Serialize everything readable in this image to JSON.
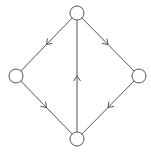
{
  "diagram": {
    "type": "directed-graph",
    "colors": {
      "stroke": "#555555",
      "node_fill": "#ffffff",
      "background": "#ffffff"
    },
    "node_radius": 7,
    "nodes": [
      {
        "id": "top",
        "x": 77,
        "y": 13
      },
      {
        "id": "left",
        "x": 16,
        "y": 76
      },
      {
        "id": "right",
        "x": 139,
        "y": 76
      },
      {
        "id": "bottom",
        "x": 77,
        "y": 139
      }
    ],
    "edges": [
      {
        "from": "top",
        "to": "left",
        "arrow_at": 0.5
      },
      {
        "from": "top",
        "to": "right",
        "arrow_at": 0.5
      },
      {
        "from": "left",
        "to": "bottom",
        "arrow_at": 0.5
      },
      {
        "from": "right",
        "to": "bottom",
        "arrow_at": 0.5
      },
      {
        "from": "bottom",
        "to": "top",
        "arrow_at": 0.5
      }
    ]
  }
}
